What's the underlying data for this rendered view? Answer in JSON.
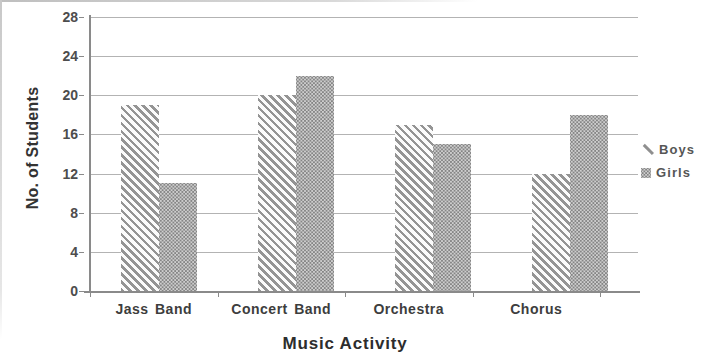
{
  "chart_data": {
    "type": "bar",
    "title": "",
    "categories": [
      "Jass Band",
      "Concert Band",
      "Orchestra",
      "Chorus"
    ],
    "series": [
      {
        "name": "Boys",
        "values": [
          19,
          20,
          17,
          12
        ],
        "pattern": "diagonal-stripes",
        "color": "#949494"
      },
      {
        "name": "Girls",
        "values": [
          11,
          22,
          15,
          18
        ],
        "pattern": "dot-weave",
        "color": "#858585"
      }
    ],
    "xlabel": "Music Activity",
    "ylabel": "No. of Students",
    "ylim": [
      0,
      28
    ],
    "yticks": [
      0,
      4,
      8,
      12,
      16,
      20,
      24,
      28
    ],
    "grid": true,
    "legend_position": "right"
  },
  "colors": {
    "background": "#ffffff",
    "gridline": "#b3b3b3",
    "axis_line": "#8a8a8a",
    "tick_text": "#4d4d4d",
    "category_text": "#3d3d3d",
    "axis_title_text": "#2d2d2d",
    "legend_text": "#565656"
  }
}
